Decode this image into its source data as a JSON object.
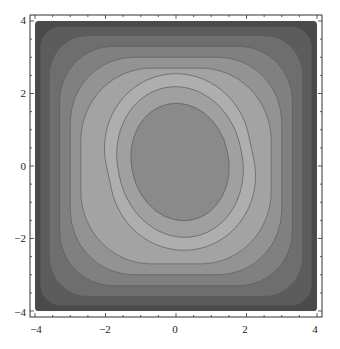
{
  "chart_data": {
    "type": "contour",
    "title": "",
    "xlabel": "",
    "ylabel": "",
    "xlim": [
      -4,
      4
    ],
    "ylim": [
      -4,
      4
    ],
    "grid": false,
    "legend": null,
    "x_ticks": [
      "-4",
      "-2",
      "0",
      "2",
      "4"
    ],
    "y_ticks": [
      "-4",
      "-2",
      "0",
      "2",
      "4"
    ],
    "levels": 9,
    "bands": [
      {
        "level": 0,
        "fill": "#4a4a4a",
        "half_width": 4.0,
        "rx": 0.1
      },
      {
        "level": 1,
        "fill": "#5c5c5c",
        "half_width": 3.85,
        "rx": 0.6
      },
      {
        "level": 2,
        "fill": "#6e6e6e",
        "half_width": 3.6,
        "rx": 1.1
      },
      {
        "level": 3,
        "fill": "#808080",
        "half_width": 3.3,
        "rx": 1.5
      },
      {
        "level": 4,
        "fill": "#939393",
        "half_width": 3.0,
        "rx": 1.8
      },
      {
        "level": 5,
        "fill": "#a3a3a3",
        "half_width": 2.7,
        "rx": 2.0
      },
      {
        "level": 6,
        "fill": "#aeaeae",
        "half_width": 2.4,
        "rx": 2.1
      },
      {
        "level": 7,
        "fill": "#a0a0a0",
        "half_width": 2.05,
        "rx": 2.0
      },
      {
        "level": 8,
        "fill": "#8a8a8a",
        "half_width": 1.6,
        "rx": 1.6
      }
    ]
  }
}
